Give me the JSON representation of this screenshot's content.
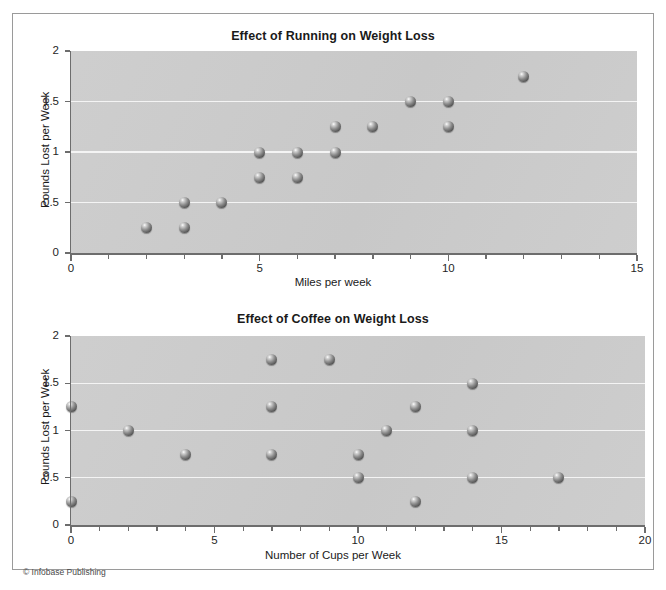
{
  "figure": {
    "credit": "© Infobase Publishing"
  },
  "chart_data": [
    {
      "type": "scatter",
      "title": "Effect of Running on Weight Loss",
      "xlabel": "Miles per week",
      "ylabel": "Pounds Lost per Week",
      "xlim": [
        0,
        15
      ],
      "ylim": [
        0,
        2
      ],
      "xticks": [
        0,
        5,
        10,
        15
      ],
      "xticklabels": [
        "0",
        "5",
        "10",
        "15"
      ],
      "yticks": [
        0,
        0.5,
        1,
        1.5,
        2
      ],
      "yticklabels": [
        "0",
        "0.5",
        "1",
        "1.5",
        "2"
      ],
      "xminor_step": 1,
      "grid": "horizontal",
      "legend": "none",
      "plot_background": "#cccccc",
      "gridline_color": "#f4f4f4",
      "marker": "sphere-gray",
      "points": [
        {
          "x": 2,
          "y": 0.25
        },
        {
          "x": 3,
          "y": 0.5
        },
        {
          "x": 3,
          "y": 0.25
        },
        {
          "x": 4,
          "y": 0.5
        },
        {
          "x": 5,
          "y": 1.0
        },
        {
          "x": 5,
          "y": 0.75
        },
        {
          "x": 6,
          "y": 1.0
        },
        {
          "x": 6,
          "y": 0.75
        },
        {
          "x": 7,
          "y": 1.25
        },
        {
          "x": 7,
          "y": 1.0
        },
        {
          "x": 8,
          "y": 1.25
        },
        {
          "x": 9,
          "y": 1.5
        },
        {
          "x": 10,
          "y": 1.5
        },
        {
          "x": 10,
          "y": 1.25
        },
        {
          "x": 12,
          "y": 1.75
        }
      ]
    },
    {
      "type": "scatter",
      "title": "Effect of Coffee on Weight Loss",
      "xlabel": "Number of Cups per Week",
      "ylabel": "Pounds Lost per Week",
      "xlim": [
        0,
        20
      ],
      "ylim": [
        0,
        2
      ],
      "xticks": [
        0,
        5,
        10,
        15,
        20
      ],
      "xticklabels": [
        "0",
        "5",
        "10",
        "15",
        "20"
      ],
      "yticks": [
        0,
        0.5,
        1,
        1.5,
        2
      ],
      "yticklabels": [
        "0",
        "0.5",
        "1",
        "1.5",
        "2"
      ],
      "xminor_step": 1,
      "grid": "horizontal",
      "legend": "none",
      "plot_background": "#cccccc",
      "gridline_color": "#f4f4f4",
      "marker": "sphere-gray",
      "points": [
        {
          "x": 0,
          "y": 1.25
        },
        {
          "x": 0,
          "y": 0.25
        },
        {
          "x": 2,
          "y": 1.0
        },
        {
          "x": 4,
          "y": 0.75
        },
        {
          "x": 7,
          "y": 1.75
        },
        {
          "x": 7,
          "y": 1.25
        },
        {
          "x": 7,
          "y": 0.75
        },
        {
          "x": 9,
          "y": 1.75
        },
        {
          "x": 10,
          "y": 0.75
        },
        {
          "x": 10,
          "y": 0.5
        },
        {
          "x": 11,
          "y": 1.0
        },
        {
          "x": 12,
          "y": 1.25
        },
        {
          "x": 12,
          "y": 0.25
        },
        {
          "x": 14,
          "y": 1.5
        },
        {
          "x": 14,
          "y": 1.0
        },
        {
          "x": 14,
          "y": 0.5
        },
        {
          "x": 17,
          "y": 0.5
        }
      ]
    }
  ]
}
